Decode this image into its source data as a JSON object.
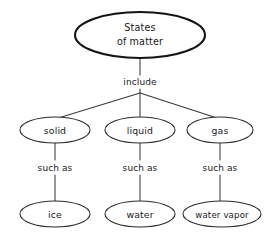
{
  "diagram": {
    "type": "concept-map",
    "title_node": "States of matter",
    "background_color": "#ffffff",
    "stroke_color": "#2b2b2b",
    "text_color": "#1a1a1a",
    "root": {
      "line1": "States",
      "line2": "of matter"
    },
    "root_edge_label": "include",
    "categories": [
      {
        "label": "solid",
        "edge_label": "such as",
        "example": "ice"
      },
      {
        "label": "liquid",
        "edge_label": "such as",
        "example": "water"
      },
      {
        "label": "gas",
        "edge_label": "such as",
        "example": "water vapor"
      }
    ]
  }
}
